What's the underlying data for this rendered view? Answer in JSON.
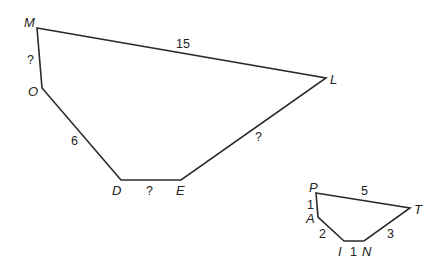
{
  "diagram": {
    "large_polygon": {
      "name": "MLEDO",
      "vertices": [
        {
          "label": "M",
          "x": 37,
          "y": 28
        },
        {
          "label": "L",
          "x": 326,
          "y": 78
        },
        {
          "label": "E",
          "x": 181,
          "y": 180
        },
        {
          "label": "D",
          "x": 121,
          "y": 180
        },
        {
          "label": "O",
          "x": 42,
          "y": 88
        }
      ],
      "sides": [
        {
          "from": "M",
          "to": "L",
          "label": "15"
        },
        {
          "from": "L",
          "to": "E",
          "label": "?"
        },
        {
          "from": "E",
          "to": "D",
          "label": "?"
        },
        {
          "from": "D",
          "to": "O",
          "label": "6"
        },
        {
          "from": "O",
          "to": "M",
          "label": "?"
        }
      ]
    },
    "small_polygon": {
      "name": "PTNIA",
      "vertices": [
        {
          "label": "P",
          "x": 316,
          "y": 193
        },
        {
          "label": "T",
          "x": 410,
          "y": 208
        },
        {
          "label": "N",
          "x": 364,
          "y": 241
        },
        {
          "label": "I",
          "x": 344,
          "y": 241
        },
        {
          "label": "A",
          "x": 318,
          "y": 217
        }
      ],
      "sides": [
        {
          "from": "P",
          "to": "T",
          "label": "5"
        },
        {
          "from": "T",
          "to": "N",
          "label": "3"
        },
        {
          "from": "N",
          "to": "I",
          "label": "1"
        },
        {
          "from": "I",
          "to": "A",
          "label": "2"
        },
        {
          "from": "A",
          "to": "P",
          "label": "1"
        }
      ]
    },
    "labels": {
      "M": "M",
      "L": "L",
      "E": "E",
      "D": "D",
      "O": "O",
      "P": "P",
      "T": "T",
      "N": "N",
      "I": "I",
      "A": "A",
      "side_ML": "15",
      "side_LE": "?",
      "side_ED": "?",
      "side_DO": "6",
      "side_OM": "?",
      "side_PT": "5",
      "side_TN": "3",
      "side_NI": "1",
      "side_IA": "2",
      "side_AP": "1"
    },
    "colors": {
      "line": "#2a2a2a",
      "text": "#222222",
      "background": "#ffffff"
    }
  }
}
